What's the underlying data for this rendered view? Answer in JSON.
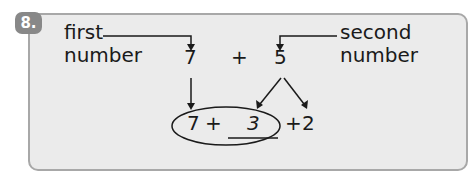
{
  "problem": {
    "number": "8.",
    "labels": {
      "first_line1": "first",
      "first_line2": "number",
      "second_line1": "second",
      "second_line2": "number"
    },
    "expression": {
      "a": "7",
      "op": "+",
      "b": "5"
    },
    "decomposed": {
      "a": "7",
      "plus1": "+",
      "blank_value": "3",
      "plus2": "+",
      "c": "2"
    },
    "colors": {
      "card_bg": "#ebebeb",
      "card_border": "#a8a8a8",
      "badge_bg": "#888888",
      "ink": "#1a1a1a"
    }
  }
}
